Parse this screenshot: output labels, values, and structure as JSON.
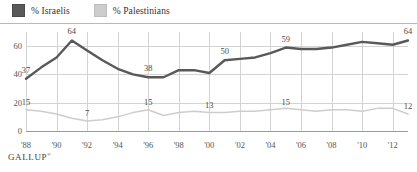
{
  "legend": {
    "items": [
      {
        "label": "% Israelis",
        "color": "#595959",
        "swatch_name": "legend-swatch-israelis"
      },
      {
        "label": "% Palestinians",
        "color": "#cdcdcd",
        "swatch_name": "legend-swatch-palestinians"
      }
    ]
  },
  "footer": {
    "source": "GALLUP",
    "trademark": "®"
  },
  "chart_data": {
    "type": "line",
    "title": "",
    "subtitle": "",
    "xlabel": "",
    "ylabel": "",
    "ylim": [
      0,
      70
    ],
    "yticks": [
      0,
      20,
      40,
      60
    ],
    "ytick_labels": [
      "0",
      "20",
      "40",
      "60"
    ],
    "grid": true,
    "legend_position": "top-left",
    "x": [
      1988,
      1989,
      1990,
      1991,
      1992,
      1993,
      1994,
      1995,
      1996,
      1997,
      1998,
      1999,
      2000,
      2001,
      2002,
      2003,
      2004,
      2005,
      2006,
      2007,
      2008,
      2009,
      2010,
      2011,
      2012,
      2013
    ],
    "xticks": [
      1988,
      1990,
      1992,
      1994,
      1996,
      1998,
      2000,
      2002,
      2004,
      2006,
      2008,
      2010,
      2012
    ],
    "xtick_labels": [
      "'88",
      "'90",
      "'92",
      "'94",
      "'96",
      "'98",
      "'00",
      "'02",
      "'04",
      "'06",
      "'08",
      "'10",
      "'12"
    ],
    "series": [
      {
        "name": "% Israelis",
        "color": "#595959",
        "values": [
          37,
          45,
          52,
          64,
          57,
          50,
          44,
          40,
          38,
          38,
          43,
          43,
          41,
          50,
          51,
          52,
          55,
          59,
          58,
          58,
          59,
          61,
          63,
          62,
          61,
          64
        ],
        "labels": [
          {
            "x": 1988,
            "value": 37,
            "text": "37"
          },
          {
            "x": 1991,
            "value": 64,
            "text": "64"
          },
          {
            "x": 1996,
            "value": 38,
            "text": "38"
          },
          {
            "x": 2001,
            "value": 50,
            "text": "50"
          },
          {
            "x": 2005,
            "value": 59,
            "text": "59"
          },
          {
            "x": 2013,
            "value": 64,
            "text": "64"
          }
        ]
      },
      {
        "name": "% Palestinians",
        "color": "#cdcdcd",
        "values": [
          15,
          14,
          12,
          9,
          7,
          8,
          10,
          13,
          15,
          11,
          13,
          14,
          13,
          13,
          14,
          14,
          15,
          16,
          15,
          14,
          15,
          15,
          14,
          16,
          16,
          12
        ],
        "labels": [
          {
            "x": 1988,
            "value": 15,
            "text": "15"
          },
          {
            "x": 1992,
            "value": 7,
            "text": "7"
          },
          {
            "x": 1996,
            "value": 15,
            "text": "15"
          },
          {
            "x": 2000,
            "value": 13,
            "text": "13"
          },
          {
            "x": 2005,
            "value": 15,
            "text": "15"
          },
          {
            "x": 2013,
            "value": 12,
            "text": "12"
          }
        ]
      }
    ]
  }
}
